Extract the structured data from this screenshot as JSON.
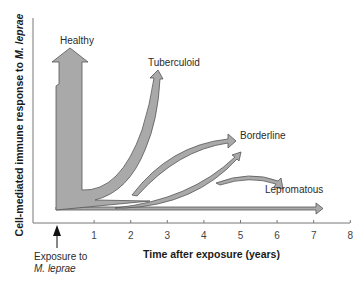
{
  "chart_data": {
    "type": "diagram",
    "title": "",
    "xlabel": "Time after exposure (years)",
    "ylabel": "Cell-mediated immune response to M. leprae",
    "ylabel_parts": {
      "prefix": "Cell-mediated immune response to ",
      "italic": "M. leprae"
    },
    "x_ticks": [
      1,
      2,
      3,
      4,
      5,
      6,
      7,
      8
    ],
    "xlim": [
      0,
      8
    ],
    "exposure_marker": {
      "line1": "Exposure to",
      "line2": "M. leprae",
      "x": 0
    },
    "outcomes": [
      {
        "name": "Healthy",
        "label": "Healthy",
        "end_year": 0.4,
        "relative_response": "highest",
        "description": "immediate strong response"
      },
      {
        "name": "Tuberculoid",
        "label": "Tuberculoid",
        "end_year": 3.0,
        "relative_response": "high"
      },
      {
        "name": "Borderline",
        "label": "Borderline",
        "end_year": 4.6,
        "relative_response": "medium",
        "branches": 2
      },
      {
        "name": "Lepromatous",
        "label": "Lepromatous",
        "end_year": 7.2,
        "relative_response": "lowest",
        "branches": 2
      }
    ]
  }
}
